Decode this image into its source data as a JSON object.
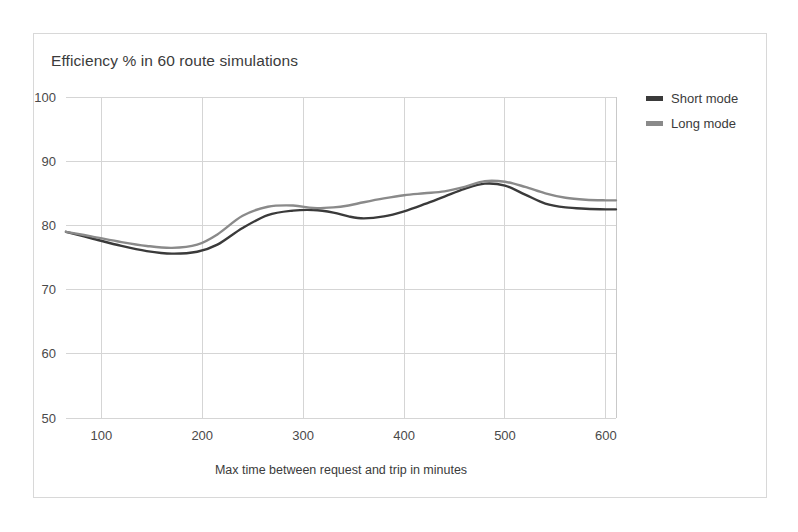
{
  "chart_data": {
    "type": "line",
    "title": "Efficiency % in 60 route simulations",
    "xlabel": "Max time between request and trip in minutes",
    "ylabel": "",
    "xlim": [
      65,
      610
    ],
    "ylim": [
      50,
      100
    ],
    "xticks": [
      100,
      200,
      300,
      400,
      500,
      600
    ],
    "yticks": [
      50,
      60,
      70,
      80,
      90,
      100
    ],
    "xtick_labels": [
      "100",
      "200",
      "300",
      "400",
      "500",
      "600"
    ],
    "ytick_labels": [
      "50",
      "60",
      "70",
      "80",
      "90",
      "100"
    ],
    "grid": "both",
    "legend_position": "right",
    "series": [
      {
        "name": "Short mode",
        "color": "#3a3a3a",
        "x": [
          65,
          90,
          120,
          145,
          170,
          195,
          215,
          240,
          265,
          290,
          310,
          330,
          345,
          360,
          380,
          400,
          420,
          440,
          460,
          480,
          500,
          520,
          540,
          560,
          580,
          600,
          610
        ],
        "values": [
          79.0,
          78.0,
          76.8,
          76.0,
          75.6,
          75.9,
          77.0,
          79.6,
          81.6,
          82.3,
          82.4,
          82.0,
          81.4,
          81.1,
          81.4,
          82.2,
          83.3,
          84.5,
          85.7,
          86.5,
          86.2,
          84.8,
          83.4,
          82.8,
          82.6,
          82.5,
          82.5
        ]
      },
      {
        "name": "Long mode",
        "color": "#8a8a8a",
        "x": [
          65,
          90,
          120,
          145,
          170,
          195,
          215,
          240,
          265,
          290,
          310,
          330,
          345,
          360,
          380,
          400,
          420,
          440,
          460,
          480,
          500,
          520,
          540,
          560,
          580,
          600,
          610
        ],
        "values": [
          79.0,
          78.3,
          77.4,
          76.8,
          76.5,
          77.0,
          78.6,
          81.5,
          82.9,
          83.1,
          82.7,
          82.8,
          83.1,
          83.6,
          84.2,
          84.7,
          85.0,
          85.3,
          86.0,
          86.9,
          86.8,
          86.0,
          85.0,
          84.3,
          84.0,
          83.9,
          83.9
        ]
      }
    ]
  },
  "legend": {
    "entries": [
      {
        "label": "Short mode",
        "color": "#3a3a3a"
      },
      {
        "label": "Long mode",
        "color": "#8a8a8a"
      }
    ]
  }
}
